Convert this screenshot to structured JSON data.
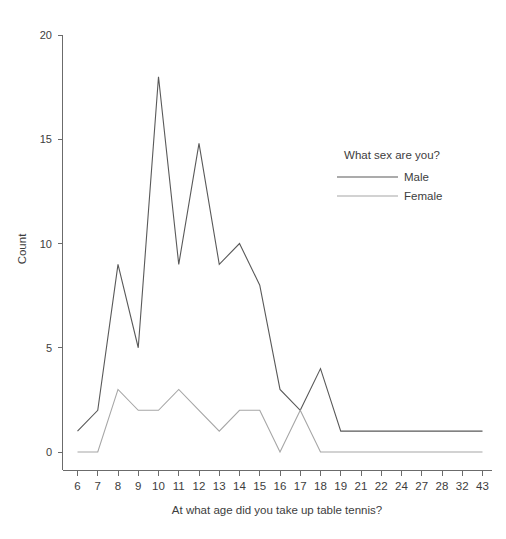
{
  "chart_data": {
    "type": "line",
    "title": "",
    "xlabel": "At what age did you take up table tennis?",
    "ylabel": "Count",
    "categories": [
      "6",
      "7",
      "8",
      "9",
      "10",
      "11",
      "12",
      "13",
      "14",
      "15",
      "16",
      "17",
      "18",
      "19",
      "21",
      "22",
      "24",
      "27",
      "28",
      "32",
      "43"
    ],
    "series": [
      {
        "name": "Male",
        "color": "#595959",
        "values": [
          1,
          2,
          9,
          5,
          18,
          9,
          14.8,
          9,
          10,
          8,
          3,
          2,
          4,
          1,
          1,
          1,
          1,
          1,
          1,
          1,
          1
        ]
      },
      {
        "name": "Female",
        "color": "#a6a6a6",
        "values": [
          0,
          0,
          3,
          2,
          2,
          3,
          2,
          1,
          2,
          2,
          0,
          2,
          0,
          0,
          0,
          0,
          0,
          0,
          0,
          0,
          0
        ]
      }
    ],
    "ylim": [
      0,
      20
    ],
    "yticks": [
      0,
      5,
      10,
      15,
      20
    ],
    "ytick_labels": [
      "0",
      "5",
      "10",
      "15",
      "20"
    ],
    "grid": false,
    "legend": {
      "title": "What sex are you?",
      "position": "upper-right",
      "entries": [
        "Male",
        "Female"
      ]
    }
  },
  "legend": {
    "title": "What sex are you?",
    "items": [
      {
        "label": "Male",
        "color": "#595959"
      },
      {
        "label": "Female",
        "color": "#a6a6a6"
      }
    ]
  },
  "axes": {
    "y_title": "Count",
    "x_title": "At what age did you take up table tennis?"
  }
}
